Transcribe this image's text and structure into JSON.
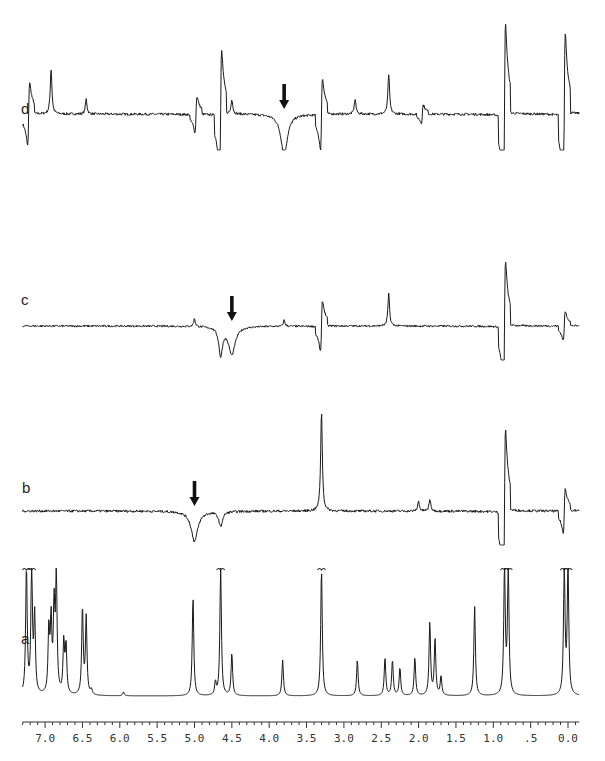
{
  "chart_data": {
    "type": "line",
    "title": "",
    "xlabel": "ppm (chemical shift)",
    "ylabel": "",
    "xlim": [
      7.3,
      -0.15
    ],
    "x_reversed": true,
    "grid": false,
    "x_ticks": [
      "7.0",
      "6.5",
      "6.0",
      "5.5",
      "5.0",
      "4.5",
      "4.0",
      "3.5",
      "3.0",
      "2.5",
      "2.0",
      "1.5",
      "1.0",
      ".5",
      "0.0"
    ],
    "x_tick_values": [
      7.0,
      6.5,
      6.0,
      5.5,
      5.0,
      4.5,
      4.0,
      3.5,
      3.0,
      2.5,
      2.0,
      1.5,
      1.0,
      0.5,
      0.0
    ],
    "panels": [
      {
        "label": "d",
        "kind": "NOE difference spectrum",
        "irradiated_ppm": 3.8,
        "arrow_ppm": 3.8,
        "peaks": [
          {
            "ppm": 7.22,
            "height": 0.35,
            "sign": "dispersive"
          },
          {
            "ppm": 6.92,
            "height": 0.45,
            "sign": "positive"
          },
          {
            "ppm": 6.45,
            "height": 0.15,
            "sign": "positive"
          },
          {
            "ppm": 4.98,
            "height": 0.2,
            "sign": "dispersive"
          },
          {
            "ppm": 4.65,
            "height": 0.7,
            "sign": "dispersive"
          },
          {
            "ppm": 4.5,
            "height": 0.15,
            "sign": "positive"
          },
          {
            "ppm": 3.8,
            "height": -0.4,
            "sign": "negative (irradiated)"
          },
          {
            "ppm": 3.3,
            "height": 0.4,
            "sign": "dispersive"
          },
          {
            "ppm": 2.85,
            "height": 0.15,
            "sign": "positive"
          },
          {
            "ppm": 2.4,
            "height": 0.4,
            "sign": "positive"
          },
          {
            "ppm": 1.95,
            "height": 0.1,
            "sign": "dispersive"
          },
          {
            "ppm": 0.85,
            "height": 1.0,
            "sign": "dispersive"
          },
          {
            "ppm": 0.05,
            "height": 0.9,
            "sign": "dispersive"
          }
        ]
      },
      {
        "label": "c",
        "kind": "NOE difference spectrum",
        "irradiated_ppm": 4.5,
        "arrow_ppm": 4.5,
        "peaks": [
          {
            "ppm": 5.0,
            "height": 0.1,
            "sign": "positive"
          },
          {
            "ppm": 4.65,
            "height": -0.35,
            "sign": "negative"
          },
          {
            "ppm": 4.5,
            "height": -0.35,
            "sign": "negative (irradiated)"
          },
          {
            "ppm": 3.8,
            "height": 0.08,
            "sign": "positive"
          },
          {
            "ppm": 3.3,
            "height": 0.35,
            "sign": "dispersive"
          },
          {
            "ppm": 2.4,
            "height": 0.4,
            "sign": "positive"
          },
          {
            "ppm": 0.85,
            "height": 0.9,
            "sign": "dispersive"
          },
          {
            "ppm": 0.05,
            "height": 0.2,
            "sign": "dispersive"
          }
        ]
      },
      {
        "label": "b",
        "kind": "NOE difference spectrum",
        "irradiated_ppm": 5.0,
        "arrow_ppm": 5.0,
        "peaks": [
          {
            "ppm": 5.0,
            "height": -0.3,
            "sign": "negative (irradiated)"
          },
          {
            "ppm": 4.65,
            "height": -0.15,
            "sign": "negative"
          },
          {
            "ppm": 3.3,
            "height": 1.0,
            "sign": "positive"
          },
          {
            "ppm": 2.0,
            "height": 0.1,
            "sign": "positive"
          },
          {
            "ppm": 1.85,
            "height": 0.12,
            "sign": "positive"
          },
          {
            "ppm": 0.85,
            "height": 0.9,
            "sign": "dispersive"
          },
          {
            "ppm": 0.05,
            "height": 0.25,
            "sign": "dispersive"
          }
        ]
      },
      {
        "label": "a",
        "kind": "reference 1H NMR spectrum",
        "peaks": [
          {
            "ppm": 7.25,
            "height": 1.0,
            "clipped": true
          },
          {
            "ppm": 7.18,
            "height": 1.0,
            "clipped": true
          },
          {
            "ppm": 7.14,
            "height": 0.6
          },
          {
            "ppm": 6.95,
            "height": 0.5
          },
          {
            "ppm": 6.92,
            "height": 0.55
          },
          {
            "ppm": 6.88,
            "height": 0.65
          },
          {
            "ppm": 6.85,
            "height": 0.9
          },
          {
            "ppm": 6.75,
            "height": 0.4
          },
          {
            "ppm": 6.72,
            "height": 0.38
          },
          {
            "ppm": 6.5,
            "height": 0.68
          },
          {
            "ppm": 6.45,
            "height": 0.6
          },
          {
            "ppm": 6.38,
            "height": 0.04
          },
          {
            "ppm": 5.95,
            "height": 0.03
          },
          {
            "ppm": 5.02,
            "height": 0.78
          },
          {
            "ppm": 4.72,
            "height": 0.1
          },
          {
            "ppm": 4.65,
            "height": 1.0,
            "clipped": true
          },
          {
            "ppm": 4.5,
            "height": 0.33
          },
          {
            "ppm": 3.82,
            "height": 0.28
          },
          {
            "ppm": 3.3,
            "height": 1.0,
            "clipped": true
          },
          {
            "ppm": 2.82,
            "height": 0.28
          },
          {
            "ppm": 2.45,
            "height": 0.3
          },
          {
            "ppm": 2.35,
            "height": 0.28
          },
          {
            "ppm": 2.25,
            "height": 0.22
          },
          {
            "ppm": 2.05,
            "height": 0.3
          },
          {
            "ppm": 1.85,
            "height": 0.57
          },
          {
            "ppm": 1.78,
            "height": 0.44
          },
          {
            "ppm": 1.7,
            "height": 0.15
          },
          {
            "ppm": 1.25,
            "height": 0.7
          },
          {
            "ppm": 0.85,
            "height": 1.0,
            "clipped": true
          },
          {
            "ppm": 0.8,
            "height": 1.0,
            "clipped": true
          },
          {
            "ppm": 0.05,
            "height": 1.0,
            "clipped": true
          },
          {
            "ppm": 0.0,
            "height": 1.0,
            "clipped": true
          }
        ]
      }
    ],
    "annotations": [
      "down-arrow over irradiated peak in panels b, c, d"
    ]
  },
  "panel_labels": {
    "d": "d",
    "c": "c",
    "b": "b",
    "a": "a"
  },
  "axis": {
    "tick_labels": [
      "7.0",
      "6.5",
      "6.0",
      "5.5",
      "5.0",
      "4.5",
      "4.0",
      "3.5",
      "3.0",
      "2.5",
      "2.0",
      "1.5",
      "1.0",
      ".5",
      "0.0"
    ]
  }
}
